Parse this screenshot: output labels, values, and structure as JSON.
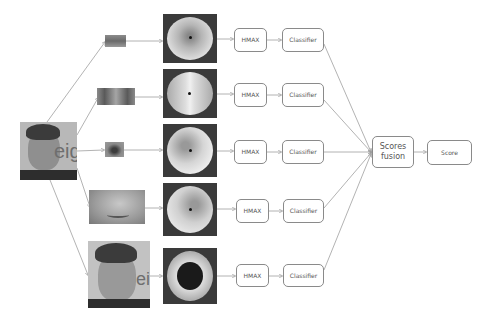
{
  "diagram": {
    "title": "",
    "input": {
      "label": "input-face",
      "description": "Full face photograph"
    },
    "branches": [
      {
        "crop": "Region crop 1 (eye / brow strip)",
        "polar": "Log-polar image 1",
        "feature": "HMAX",
        "classifier": "Classifier"
      },
      {
        "crop": "Region crop 2 (both eyes)",
        "polar": "Log-polar image 2",
        "feature": "HMAX",
        "classifier": "Classifier"
      },
      {
        "crop": "Region crop 3 (single eye)",
        "polar": "Log-polar image 3",
        "feature": "HMAX",
        "classifier": "Classifier"
      },
      {
        "crop": "Region crop 4 (nose / mouth)",
        "polar": "Log-polar image 4",
        "feature": "HMAX",
        "classifier": "Classifier"
      },
      {
        "crop": "Region crop 5 (whole face)",
        "polar": "Log-polar image 5",
        "feature": "HMAX",
        "classifier": "Classifier"
      }
    ],
    "fusion": {
      "line1": "Scores",
      "line2": "fusion"
    },
    "output": {
      "label": "Score"
    },
    "logo_fragment": "eigr",
    "colors": {
      "line": "#9a9a9a",
      "box_border": "#8a8a8a",
      "text": "#555555",
      "polar_bg": "#3a3a3a"
    }
  }
}
